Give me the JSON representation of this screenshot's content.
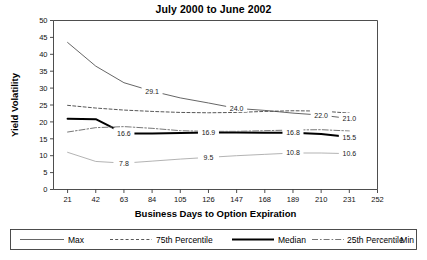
{
  "chart_data": {
    "type": "line",
    "title": "July 2000 to June 2002",
    "xlabel": "Business Days to Option Expiration",
    "ylabel": "Yield Volatility",
    "x": [
      21,
      42,
      63,
      84,
      105,
      126,
      147,
      168,
      189,
      210,
      231
    ],
    "xlim": [
      10.5,
      252
    ],
    "ylim": [
      0,
      50
    ],
    "xticks": [
      21,
      42,
      63,
      84,
      105,
      126,
      147,
      168,
      189,
      210,
      231,
      252
    ],
    "yticks": [
      0,
      5,
      10,
      15,
      20,
      25,
      30,
      35,
      40,
      45,
      50
    ],
    "grid": false,
    "legend_position": "bottom",
    "series": [
      {
        "name": "Max",
        "style": "solid-thin",
        "color": "#555555",
        "values": [
          43.5,
          36.5,
          31.6,
          29.1,
          27.1,
          25.6,
          24.0,
          23.4,
          22.6,
          22.0,
          21.0
        ],
        "labels": [
          {
            "x": 84,
            "value": "29.1"
          },
          {
            "x": 147,
            "value": "24.0"
          },
          {
            "x": 210,
            "value": "22.0"
          },
          {
            "x": 231,
            "value": "21.0"
          }
        ]
      },
      {
        "name": "75th Percentile",
        "style": "dashed",
        "color": "#444444",
        "values": [
          24.9,
          24.1,
          23.5,
          23.1,
          22.8,
          22.7,
          22.8,
          23.1,
          23.3,
          23.2,
          22.6
        ],
        "labels": []
      },
      {
        "name": "Median",
        "style": "solid-thick",
        "color": "#000000",
        "values": [
          20.9,
          20.8,
          16.6,
          16.6,
          16.7,
          16.9,
          16.9,
          16.8,
          16.8,
          16.4,
          15.5
        ],
        "labels": [
          {
            "x": 63,
            "value": "16.6"
          },
          {
            "x": 126,
            "value": "16.9"
          },
          {
            "x": 189,
            "value": "16.8"
          },
          {
            "x": 231,
            "value": "15.5"
          }
        ]
      },
      {
        "name": "25th Percentile",
        "style": "dash-dot",
        "color": "#666666",
        "values": [
          17.0,
          18.3,
          18.6,
          18.1,
          17.4,
          17.2,
          17.2,
          17.4,
          17.6,
          17.7,
          17.3
        ],
        "labels": []
      },
      {
        "name": "Min",
        "style": "solid-light",
        "color": "#aaaaaa",
        "values": [
          11.0,
          8.3,
          7.8,
          8.4,
          9.0,
          9.5,
          10.0,
          10.4,
          10.8,
          10.8,
          10.6
        ],
        "labels": [
          {
            "x": 63,
            "value": "7.8"
          },
          {
            "x": 126,
            "value": "9.5"
          },
          {
            "x": 189,
            "value": "10.8"
          },
          {
            "x": 231,
            "value": "10.6"
          }
        ]
      }
    ]
  },
  "legend": {
    "items": [
      {
        "label": "Max",
        "style": "solid-thin"
      },
      {
        "label": "75th Percentile",
        "style": "dashed"
      },
      {
        "label": "Median",
        "style": "solid-thick"
      },
      {
        "label": "25th Percentile",
        "style": "dash-dot"
      },
      {
        "label": "Min",
        "style": "solid-light"
      }
    ]
  }
}
